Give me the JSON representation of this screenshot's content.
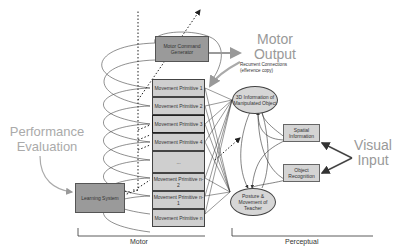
{
  "motor_command_generator": "Motor Command Generator",
  "motor_output": {
    "line1": "Motor",
    "line2": "Output"
  },
  "recurrent": {
    "line1": "Recurrent Connections",
    "line2": "(efference copy)"
  },
  "primitives": [
    "Movement Primitive 1",
    "Movement Primitive 2",
    "Movement Primitive 3",
    "Movement Primitive 4",
    "...",
    "Movement Primitive n-2",
    "Movement Primitive n-1",
    "Movement Primitive n"
  ],
  "perceptual_nodes": {
    "object_3d": "3D Information of Manipulated Object",
    "posture": "Posture & Movement of Teacher",
    "spatial": "Spatial Information",
    "recognition": "Object Recognition"
  },
  "visual_input": {
    "line1": "Visual",
    "line2": "Input"
  },
  "performance_evaluation": {
    "line1": "Performance",
    "line2": "Evaluation"
  },
  "learning_system": "Learning System",
  "sections": {
    "motor": "Motor",
    "perceptual": "Perceptual"
  },
  "colors": {
    "dark_box": "#9a9a9a",
    "light_box": "#cfcfcf",
    "label_gray": "#999999",
    "line": "#333333"
  }
}
